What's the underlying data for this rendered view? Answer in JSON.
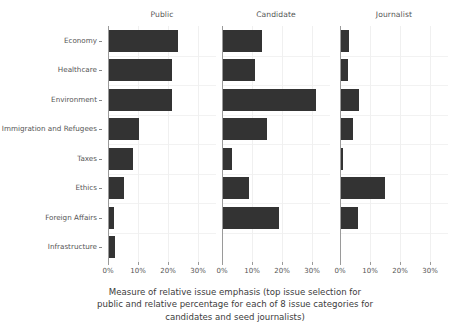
{
  "chart_data": {
    "type": "bar",
    "orientation": "horizontal",
    "title": "",
    "xlabel": "Measure of relative issue emphasis (top issue selection for public and relative percentage for each of 8 issue categories for candidates and seed journalists)",
    "ylabel": "",
    "grid": true,
    "legend": "none",
    "facet_titles": [
      "Public",
      "Candidate",
      "Journalist"
    ],
    "categories": [
      "Economy",
      "Healthcare",
      "Environment",
      "Immigration and Refugees",
      "Taxes",
      "Ethics",
      "Foreign Affairs",
      "Infrastructure"
    ],
    "xlim": [
      0,
      34
    ],
    "xticks": [
      0,
      10,
      20,
      30
    ],
    "xticklabels": [
      "0%",
      "10%",
      "20%",
      "30%"
    ],
    "series": [
      {
        "name": "Public",
        "values": [
          23.0,
          21.0,
          21.0,
          10.0,
          8.0,
          5.0,
          1.5,
          2.0
        ]
      },
      {
        "name": "Candidate",
        "values": [
          13.0,
          10.5,
          31.0,
          14.5,
          3.0,
          8.5,
          18.5,
          0.0
        ]
      },
      {
        "name": "Journalist",
        "values": [
          2.8,
          2.2,
          6.0,
          4.0,
          0.7,
          14.7,
          5.5,
          0.0
        ]
      }
    ],
    "colors": {
      "bar": "#333333",
      "grid": "#f0f0f0",
      "axis": "#9a9a9a",
      "text": "#555555",
      "background": "#ffffff"
    }
  },
  "caption": {
    "lines": [
      "Measure of relative issue emphasis (top issue selection for",
      "public and relative percentage for each of 8 issue categories for",
      "candidates and seed journalists)"
    ]
  }
}
